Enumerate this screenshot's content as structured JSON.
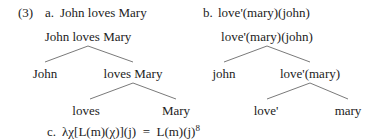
{
  "example_number": "(3)",
  "part_a": {
    "label": "a.",
    "heading": "John loves Mary",
    "tree": {
      "root": "John loves Mary",
      "left": "John",
      "right": "loves Mary",
      "right_left": "loves",
      "right_right": "Mary"
    }
  },
  "part_b": {
    "label": "b.",
    "heading": "love'(mary)(john)",
    "tree": {
      "root": "love'(mary)(john)",
      "left": "john",
      "right": "love'(mary)",
      "right_left": "love'",
      "right_right": "mary"
    }
  },
  "part_c": {
    "label": "c.",
    "formula": "λχ[L(m)(χ)](j)  =  L(m)(j)",
    "footnote": "8"
  },
  "colors": {
    "text": "#222222",
    "branch": "#7a7a7a"
  }
}
